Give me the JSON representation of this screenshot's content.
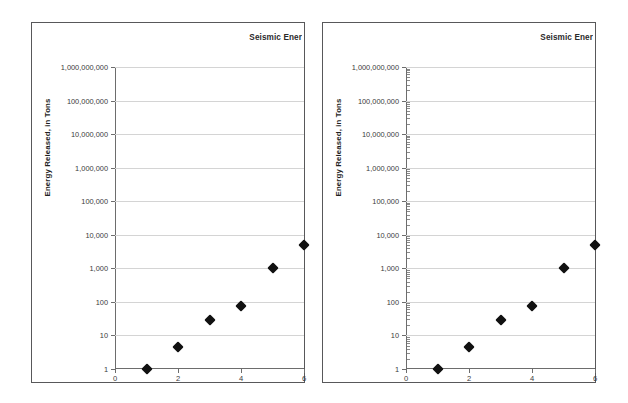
{
  "page": {
    "background_color": "#ffffff",
    "panel_border_color": "#58585a",
    "gridline_color": "#d4d4d4",
    "marker_color": "#111111"
  },
  "panels": [
    {
      "id": "left",
      "title": "Seismic Ener",
      "title_truncated": true,
      "minor_ticks": false
    },
    {
      "id": "right",
      "title": "Seismic Ener",
      "title_truncated": true,
      "minor_ticks": true
    }
  ],
  "chart_data": [
    {
      "type": "scatter",
      "title": "Seismic Ener",
      "xlabel": "",
      "ylabel": "Energy Released, in Tons",
      "yscale": "log",
      "ylim": [
        1,
        1000000000
      ],
      "xlim": [
        0,
        6
      ],
      "grid": true,
      "legend": "none",
      "marker": "diamond",
      "x": [
        1,
        2,
        3,
        4,
        5,
        6
      ],
      "values": [
        1,
        4.6,
        28,
        73,
        1000,
        5000
      ],
      "ytick_labels": [
        "1",
        "10",
        "100",
        "1,000",
        "10,000",
        "100,000",
        "1,000,000",
        "10,000,000",
        "100,000,000",
        "1,000,000,000"
      ],
      "ytick_values": [
        1,
        10,
        100,
        1000,
        10000,
        100000,
        1000000,
        10000000,
        100000000,
        1000000000
      ],
      "xtick_labels": [
        "0",
        "2",
        "4",
        "6"
      ],
      "xtick_values": [
        0,
        2,
        4,
        6
      ]
    },
    {
      "type": "scatter",
      "title": "Seismic Ener",
      "xlabel": "",
      "ylabel": "Energy Released, in Tons",
      "yscale": "log",
      "ylim": [
        1,
        1000000000
      ],
      "xlim": [
        0,
        6
      ],
      "grid": true,
      "legend": "none",
      "marker": "diamond",
      "x": [
        1,
        2,
        3,
        4,
        5,
        6
      ],
      "values": [
        1,
        4.6,
        28,
        73,
        1000,
        5000
      ],
      "ytick_labels": [
        "1",
        "10",
        "100",
        "1,000",
        "10,000",
        "100,000",
        "1,000,000",
        "10,000,000",
        "100,000,000",
        "1,000,000,000"
      ],
      "ytick_values": [
        1,
        10,
        100,
        1000,
        10000,
        100000,
        1000000,
        10000000,
        100000000,
        1000000000
      ],
      "xtick_labels": [
        "0",
        "2",
        "4",
        "6"
      ],
      "xtick_values": [
        0,
        2,
        4,
        6
      ]
    }
  ]
}
